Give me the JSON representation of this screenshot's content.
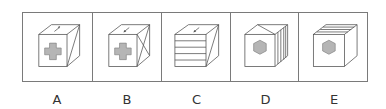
{
  "options": [
    {
      "label": "A",
      "front": "cross",
      "top": "arrow-up-right",
      "side": "single-diagonal"
    },
    {
      "label": "B",
      "front": "cross",
      "top": "arrow-down-left",
      "side": "x-diagonals"
    },
    {
      "label": "C",
      "front": "horizontal-stripes",
      "top": "arrow-down-left",
      "side": "single-diagonal"
    },
    {
      "label": "D",
      "front": "hexagon",
      "top": "triangle-roof",
      "side": "vertical-stripes"
    },
    {
      "label": "E",
      "front": "hexagon",
      "top": "diagonal-stripes",
      "side": "blank"
    }
  ],
  "colors": {
    "line": "#555555",
    "fill": "#b5b5b5",
    "frame": "#7a7a7a"
  }
}
